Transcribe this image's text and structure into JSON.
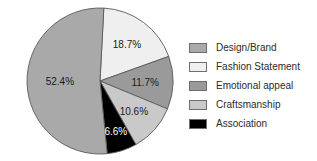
{
  "chart_data": {
    "type": "pie",
    "title": "",
    "subtitle": "",
    "xlabel": "",
    "ylabel": "",
    "grid": false,
    "legend_position": "right",
    "start_angle_deg": 3,
    "direction": "clockwise",
    "categories": [
      "Design/Brand",
      "Fashion Statement",
      "Emotional appeal",
      "Craftsmanship",
      "Association"
    ],
    "values": [
      52.4,
      18.7,
      11.7,
      10.6,
      6.6
    ],
    "value_unit": "%",
    "colors": [
      "#a9a9a9",
      "#efefef",
      "#9a9a9a",
      "#c9c9c9",
      "#000000"
    ],
    "slices": [
      {
        "label": "Fashion Statement",
        "value": 18.7,
        "display": "18.7%",
        "color": "#efefef",
        "label_color": "#1a1a1a"
      },
      {
        "label": "Emotional appeal",
        "value": 11.7,
        "display": "11.7%",
        "color": "#9a9a9a",
        "label_color": "#1a1a1a"
      },
      {
        "label": "Craftsmanship",
        "value": 10.6,
        "display": "10.6%",
        "color": "#c9c9c9",
        "label_color": "#1a1a1a"
      },
      {
        "label": "Association",
        "value": 6.6,
        "display": "6.6%",
        "color": "#000000",
        "label_color": "#ffffff"
      },
      {
        "label": "Design/Brand",
        "value": 52.4,
        "display": "52.4%",
        "color": "#a9a9a9",
        "label_color": "#1a1a1a"
      }
    ]
  },
  "legend": {
    "items": [
      {
        "label": "Design/Brand",
        "color": "#a9a9a9"
      },
      {
        "label": "Fashion Statement",
        "color": "#efefef"
      },
      {
        "label": "Emotional appeal",
        "color": "#9a9a9a"
      },
      {
        "label": "Craftsmanship",
        "color": "#c9c9c9"
      },
      {
        "label": "Association",
        "color": "#000000"
      }
    ]
  }
}
